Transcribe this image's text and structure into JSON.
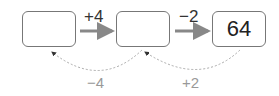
{
  "boxes": [
    {
      "value": ""
    },
    {
      "value": ""
    },
    {
      "value": "64"
    }
  ],
  "forward_ops": [
    "+4",
    "−2"
  ],
  "inverse_ops": [
    "−4",
    "+2"
  ],
  "colors": {
    "box_border": "#777777",
    "forward_arrow": "#888888",
    "inverse_arrow": "#aaaaaa",
    "inverse_label": "#999999"
  }
}
